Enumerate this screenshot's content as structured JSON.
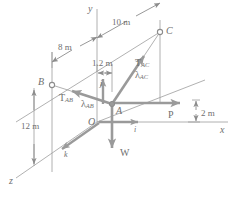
{
  "figure": {
    "kind": "3d-free-body-diagram",
    "colors": {
      "line": "#8c8c8c",
      "thick_vector": "#9a9a9a",
      "text": "#6f6f6f",
      "background": "#ffffff"
    }
  },
  "axes": {
    "x_label": "x",
    "y_label": "y",
    "z_label": "z"
  },
  "points": {
    "origin": "O",
    "node_a": "A",
    "node_b": "B",
    "node_c": "C"
  },
  "dimensions": [
    {
      "id": "dim-10m",
      "text": "10 m"
    },
    {
      "id": "dim-8m",
      "text": "8 m"
    },
    {
      "id": "dim-1p2m",
      "text": "1.2 m"
    },
    {
      "id": "dim-12m",
      "text": "12 m"
    },
    {
      "id": "dim-2m",
      "text": "2 m"
    }
  ],
  "forces": [
    {
      "id": "force-tab",
      "symbol": "T",
      "subscript": "AB"
    },
    {
      "id": "force-tac",
      "symbol": "T",
      "subscript": "AC"
    },
    {
      "id": "force-p",
      "symbol": "P",
      "subscript": ""
    },
    {
      "id": "force-w",
      "symbol": "W",
      "subscript": ""
    }
  ],
  "unit_vectors": [
    {
      "id": "lambda-ab",
      "symbol": "λ",
      "subscript": "AB"
    },
    {
      "id": "lambda-ac",
      "symbol": "λ",
      "subscript": "AC"
    },
    {
      "id": "vec-i",
      "symbol": "i"
    },
    {
      "id": "vec-j",
      "symbol": "j"
    },
    {
      "id": "vec-k",
      "symbol": "k"
    }
  ],
  "labels": {
    "dim_10m": "10 m",
    "dim_8m": "8 m",
    "dim_1p2m": "1.2 m",
    "dim_12m": "12 m",
    "dim_2m": "2 m",
    "point_A": "A",
    "point_B": "B",
    "point_C": "C",
    "point_O": "O",
    "axis_x": "x",
    "axis_y": "y",
    "axis_z": "z",
    "T": "T",
    "sub_AB": "AB",
    "sub_AC": "AC",
    "lambda": "λ",
    "P": "P",
    "W": "W",
    "i": "i",
    "j": "j",
    "k": "k"
  }
}
